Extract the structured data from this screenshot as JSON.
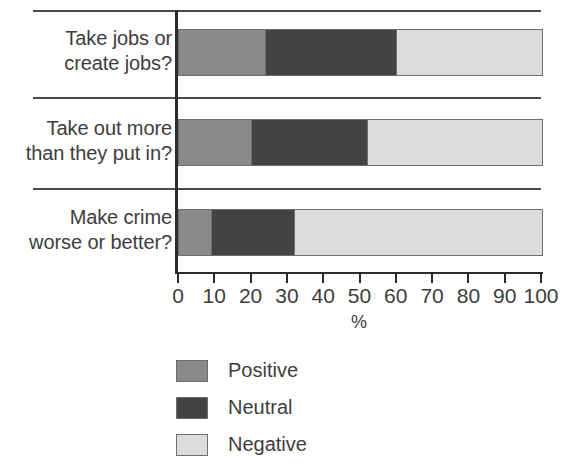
{
  "chart_data": {
    "type": "bar",
    "orientation": "horizontal",
    "stacked": true,
    "stacked_percent": true,
    "title": "",
    "xlabel": "%",
    "ylabel": "",
    "xlim": [
      0,
      100
    ],
    "xticks": [
      "0",
      "10",
      "20",
      "30",
      "40",
      "50",
      "60",
      "70",
      "80",
      "90",
      "100"
    ],
    "xtick_values": [
      0,
      10,
      20,
      30,
      40,
      50,
      60,
      70,
      80,
      90,
      100
    ],
    "grid": false,
    "legend_position": "below-left",
    "categories": [
      {
        "line1": "Take jobs or",
        "line2": "create jobs?"
      },
      {
        "line1": "Take out more",
        "line2": "than they put in?"
      },
      {
        "line1": "Make crime",
        "line2": "worse or better?"
      }
    ],
    "category_labels": [
      "Take jobs or create jobs?",
      "Take out more than they put in?",
      "Make crime worse or better?"
    ],
    "series": [
      {
        "name": "Positive",
        "color": "#8a8a8a",
        "values": [
          24,
          20,
          9
        ]
      },
      {
        "name": "Neutral",
        "color": "#434343",
        "values": [
          36,
          32,
          23
        ]
      },
      {
        "name": "Negative",
        "color": "#dcdcdc",
        "values": [
          40,
          48,
          68
        ]
      }
    ],
    "legend": [
      {
        "label": "Positive",
        "color": "#8a8a8a"
      },
      {
        "label": "Neutral",
        "color": "#434343"
      },
      {
        "label": "Negative",
        "color": "#dcdcdc"
      }
    ],
    "axis_color": "#2b2b2b",
    "separator_color": "#4a4a4a",
    "border_color": "#6e6e6e",
    "background": "#ffffff"
  }
}
